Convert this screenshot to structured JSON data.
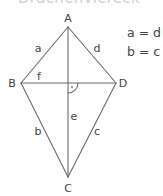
{
  "title": "Drachenviereck",
  "vertices": {
    "A": {
      "label": "A",
      "x": 68,
      "y": 27
    },
    "B": {
      "label": "B",
      "x": 21,
      "y": 83
    },
    "C": {
      "label": "C",
      "x": 68,
      "y": 177
    },
    "D": {
      "label": "D",
      "x": 116,
      "y": 83
    }
  },
  "sides": {
    "a": "a",
    "b": "b",
    "c": "c",
    "d": "d"
  },
  "diagonals": {
    "e": "e",
    "f": "f"
  },
  "equations": [
    "a = d",
    "b = c"
  ],
  "colors": {
    "stroke": "#6a6a6a",
    "text": "#444444"
  }
}
